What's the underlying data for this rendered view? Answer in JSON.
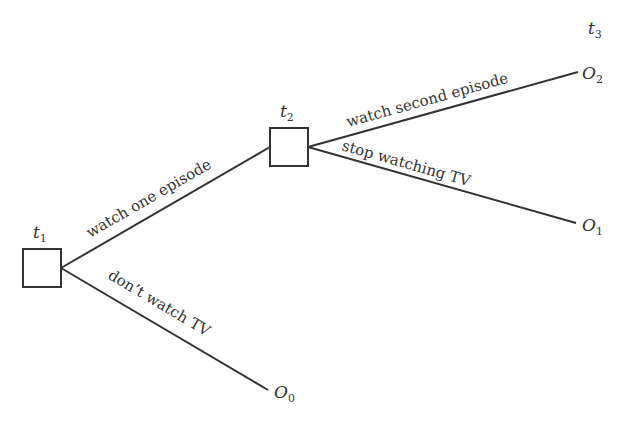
{
  "diagram": {
    "type": "decision-tree",
    "nodes": [
      {
        "id": "t1",
        "label": "t",
        "sub": "1"
      },
      {
        "id": "t2",
        "label": "t",
        "sub": "2"
      }
    ],
    "time_label": {
      "label": "t",
      "sub": "3"
    },
    "outcomes": [
      {
        "id": "O0",
        "label": "O",
        "sub": "0"
      },
      {
        "id": "O1",
        "label": "O",
        "sub": "1"
      },
      {
        "id": "O2",
        "label": "O",
        "sub": "2"
      }
    ],
    "edges": [
      {
        "from": "t1",
        "to": "t2",
        "label": "watch one episode"
      },
      {
        "from": "t1",
        "to": "O0",
        "label": "don’t watch TV"
      },
      {
        "from": "t2",
        "to": "O2",
        "label": "watch second episode"
      },
      {
        "from": "t2",
        "to": "O1",
        "label": "stop watching TV"
      }
    ]
  }
}
